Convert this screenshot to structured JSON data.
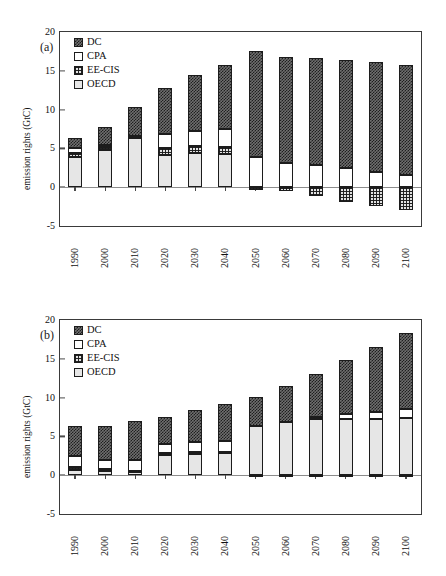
{
  "figure": {
    "background_color": "#ffffff",
    "panels": [
      "a",
      "b"
    ]
  },
  "panel_a": {
    "label": "(a)",
    "ylabel": "emission rights (GtC)",
    "yticks": [
      "20",
      "15",
      "10",
      "5",
      "0",
      "-5"
    ],
    "xticks": [
      "1990",
      "2000",
      "2010",
      "2020",
      "2030",
      "2040",
      "2050",
      "2060",
      "2070",
      "2080",
      "2090",
      "2100"
    ],
    "legend": [
      {
        "name": "DC",
        "pattern": "dark-crosshatch",
        "color": "#6f6f6f"
      },
      {
        "name": "CPA",
        "pattern": "solid-white",
        "color": "#ffffff"
      },
      {
        "name": "EE-CIS",
        "pattern": "grid",
        "color": "#e2e2e2"
      },
      {
        "name": "OECD",
        "pattern": "light-stipple",
        "color": "#e6e6e6"
      }
    ]
  },
  "panel_b": {
    "label": "(b)",
    "ylabel": "emission rights (GtC)",
    "yticks": [
      "20",
      "15",
      "10",
      "5",
      "0",
      "-5"
    ],
    "xticks": [
      "1990",
      "2000",
      "2010",
      "2020",
      "2030",
      "2040",
      "2050",
      "2060",
      "2070",
      "2080",
      "2090",
      "2100"
    ],
    "legend": [
      {
        "name": "DC",
        "pattern": "dark-crosshatch",
        "color": "#6f6f6f"
      },
      {
        "name": "CPA",
        "pattern": "solid-white",
        "color": "#ffffff"
      },
      {
        "name": "EE-CIS",
        "pattern": "grid",
        "color": "#e2e2e2"
      },
      {
        "name": "OECD",
        "pattern": "light-stipple",
        "color": "#e6e6e6"
      }
    ]
  },
  "chart_data": [
    {
      "type": "bar",
      "subtype": "stacked-vertical",
      "panel": "a",
      "title": "(a)",
      "xlabel": "",
      "ylabel": "emission rights (GtC)",
      "ylim": [
        -5,
        20
      ],
      "ytick_values": [
        20,
        15,
        10,
        5,
        0,
        -5
      ],
      "grid": false,
      "legend_position": "top-left-inside",
      "stack_order_bottom_to_top": [
        "OECD",
        "EE-CIS",
        "CPA",
        "DC"
      ],
      "categories": [
        "1990",
        "2000",
        "2010",
        "2020",
        "2030",
        "2040",
        "2050",
        "2060",
        "2070",
        "2080",
        "2090",
        "2100"
      ],
      "series": [
        {
          "name": "OECD",
          "values": [
            3.9,
            4.8,
            6.3,
            4.2,
            4.4,
            4.3,
            0.0,
            0.0,
            0.0,
            0.0,
            0.0,
            0.0
          ]
        },
        {
          "name": "EE-CIS",
          "values": [
            0.5,
            0.4,
            0.2,
            0.9,
            0.9,
            0.9,
            -0.3,
            -0.5,
            -1.2,
            -1.9,
            -2.4,
            -3.0
          ]
        },
        {
          "name": "CPA",
          "values": [
            0.6,
            0.3,
            0.1,
            1.8,
            2.0,
            2.3,
            3.9,
            3.1,
            2.8,
            2.5,
            2.0,
            1.6
          ]
        },
        {
          "name": "DC",
          "values": [
            1.3,
            2.3,
            3.7,
            5.9,
            7.2,
            8.3,
            13.6,
            13.7,
            13.9,
            13.9,
            14.1,
            14.1
          ]
        }
      ],
      "bar_totals_positive": [
        6.3,
        7.8,
        10.3,
        12.8,
        14.5,
        15.8,
        17.5,
        16.8,
        16.7,
        16.4,
        16.1,
        15.7
      ]
    },
    {
      "type": "bar",
      "subtype": "stacked-vertical",
      "panel": "b",
      "title": "(b)",
      "xlabel": "",
      "ylabel": "emission rights (GtC)",
      "ylim": [
        -5,
        20
      ],
      "ytick_values": [
        20,
        15,
        10,
        5,
        0,
        -5
      ],
      "grid": false,
      "legend_position": "top-left-inside",
      "stack_order_bottom_to_top": [
        "OECD",
        "EE-CIS",
        "CPA",
        "DC"
      ],
      "categories": [
        "1990",
        "2000",
        "2010",
        "2020",
        "2030",
        "2040",
        "2050",
        "2060",
        "2070",
        "2080",
        "2090",
        "2100"
      ],
      "series": [
        {
          "name": "OECD",
          "values": [
            0.7,
            0.6,
            0.4,
            2.6,
            2.7,
            2.8,
            6.4,
            6.8,
            7.2,
            7.3,
            7.3,
            7.4
          ]
        },
        {
          "name": "EE-CIS",
          "values": [
            0.35,
            0.25,
            0.15,
            0.3,
            0.3,
            0.15,
            -0.2,
            -0.15,
            -0.15,
            -0.2,
            -0.2,
            -0.2
          ]
        },
        {
          "name": "CPA",
          "values": [
            1.4,
            1.15,
            1.45,
            1.15,
            1.3,
            1.5,
            0.0,
            0.0,
            0.3,
            0.6,
            0.9,
            1.1
          ]
        },
        {
          "name": "DC",
          "values": [
            3.85,
            4.4,
            5.0,
            3.5,
            4.1,
            4.75,
            3.7,
            4.7,
            5.6,
            6.9,
            8.3,
            9.8
          ]
        }
      ],
      "bar_totals_positive": [
        6.3,
        6.3,
        6.9,
        7.5,
        8.4,
        9.1,
        10.1,
        11.5,
        13.1,
        14.8,
        16.5,
        18.3
      ]
    }
  ]
}
